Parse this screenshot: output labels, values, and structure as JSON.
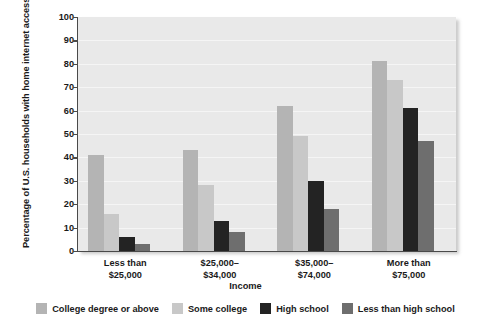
{
  "chart_data": {
    "type": "bar",
    "title": "",
    "xlabel": "Income",
    "ylabel": "Percentage of U.S. households with home internet access",
    "ylabel_line1": "Percentage of U.S. households",
    "ylabel_line2": "with home internet access",
    "categories": [
      "Less than $25,000",
      "$25,000–$34,000",
      "$35,000–$74,000",
      "More than $75,000"
    ],
    "category_lines": [
      [
        "Less than",
        "$25,000"
      ],
      [
        "$25,000–",
        "$34,000"
      ],
      [
        "$35,000–",
        "$74,000"
      ],
      [
        "More than",
        "$75,000"
      ]
    ],
    "series": [
      {
        "name": "College degree or above",
        "color": "#b4b4b4",
        "values": [
          41,
          43,
          62,
          81
        ]
      },
      {
        "name": "Some college",
        "color": "#c8c8c8",
        "values": [
          16,
          28,
          49,
          73
        ]
      },
      {
        "name": "High school",
        "color": "#232323",
        "values": [
          6,
          13,
          30,
          61
        ]
      },
      {
        "name": "Less than high school",
        "color": "#6e6e6e",
        "values": [
          3,
          8,
          18,
          47
        ]
      }
    ],
    "yticks": [
      0,
      10,
      20,
      30,
      40,
      50,
      60,
      70,
      80,
      90,
      100
    ],
    "ylim": [
      0,
      100
    ],
    "grid": true,
    "legend_position": "bottom",
    "plot_background": "#e9e9e9",
    "axis_color": "#4a4a4a"
  }
}
